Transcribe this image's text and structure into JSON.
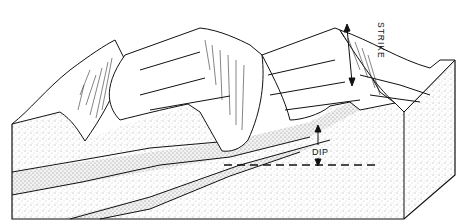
{
  "diagram": {
    "type": "geologic-block-diagram",
    "labels": {
      "strike": "STRIKE",
      "dip": "DIP"
    },
    "elements": [
      {
        "name": "block-front-face",
        "description": "stippled front face showing dipping beds"
      },
      {
        "name": "block-right-face",
        "description": "stippled right side face"
      },
      {
        "name": "ridges",
        "count": 3,
        "description": "hogback ridges on eroded top surface"
      },
      {
        "name": "strike-arrow",
        "description": "double-headed arrow along ridge crest"
      },
      {
        "name": "dip-arrow",
        "description": "arrow showing dip angle from horizontal dashed line"
      },
      {
        "name": "horizontal-reference",
        "description": "dashed horizontal line"
      }
    ],
    "colors": {
      "line": "#111111",
      "stipple": "#9a9a9a",
      "background": "#ffffff"
    }
  }
}
